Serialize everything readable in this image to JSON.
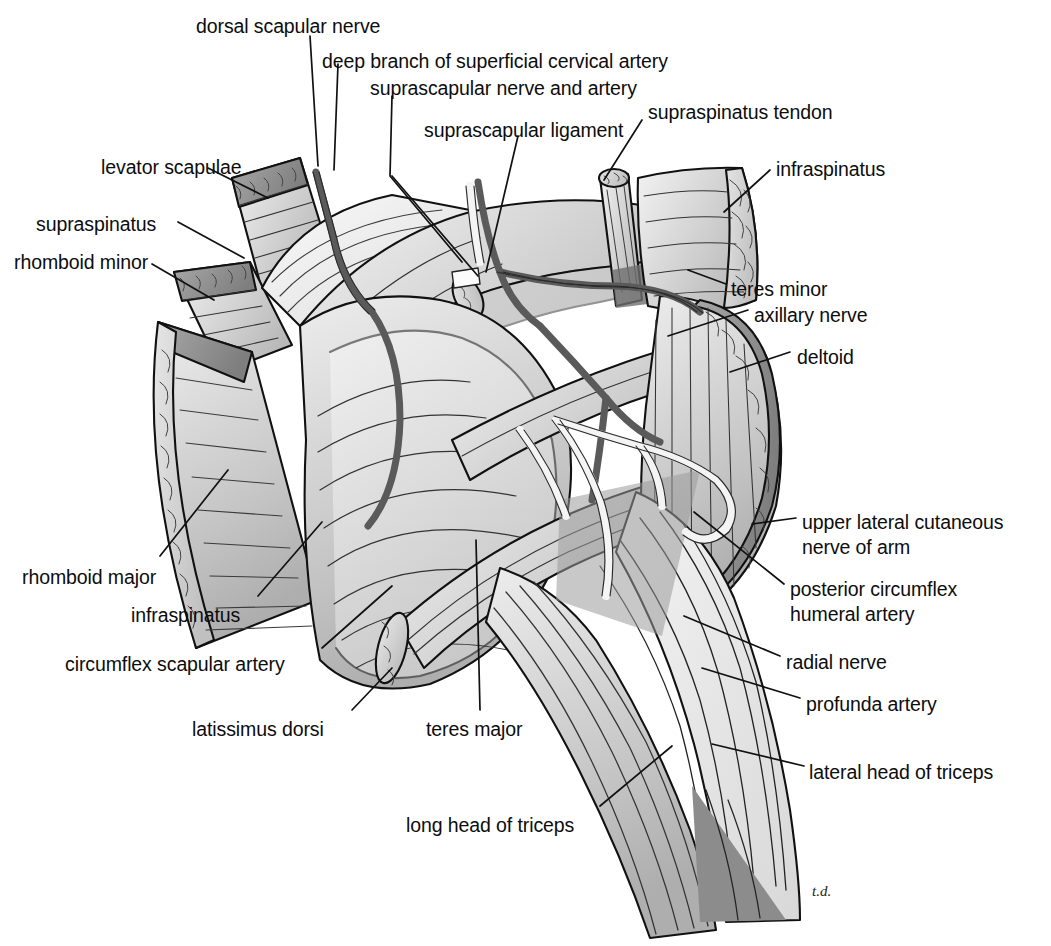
{
  "figure": {
    "signature": "t.d.",
    "background_color": "#ffffff",
    "ink_color": "#111111"
  },
  "labels": [
    {
      "id": "dorsal-scapular-nerve",
      "text": "dorsal scapular nerve",
      "x": 196,
      "y": 14,
      "align": "left"
    },
    {
      "id": "deep-branch-superficial-cervical",
      "text": "deep branch of superficial cervical artery",
      "x": 322,
      "y": 49,
      "align": "left"
    },
    {
      "id": "suprascapular-nerve-and-artery",
      "text": "suprascapular nerve and artery",
      "x": 370,
      "y": 76,
      "align": "left"
    },
    {
      "id": "suprascapular-ligament",
      "text": "suprascapular ligament",
      "x": 424,
      "y": 118,
      "align": "left"
    },
    {
      "id": "supraspinatus-tendon",
      "text": "supraspinatus tendon",
      "x": 648,
      "y": 100,
      "align": "left"
    },
    {
      "id": "infraspinatus-right",
      "text": "infraspinatus",
      "x": 776,
      "y": 157,
      "align": "left"
    },
    {
      "id": "levator-scapulae",
      "text": "levator scapulae",
      "x": 101,
      "y": 155,
      "align": "left"
    },
    {
      "id": "supraspinatus-left",
      "text": "supraspinatus",
      "x": 36,
      "y": 212,
      "align": "left"
    },
    {
      "id": "rhomboid-minor",
      "text": "rhomboid minor",
      "x": 14,
      "y": 250,
      "align": "left"
    },
    {
      "id": "teres-minor",
      "text": "teres minor",
      "x": 731,
      "y": 277,
      "align": "left"
    },
    {
      "id": "axillary-nerve",
      "text": "axillary nerve",
      "x": 754,
      "y": 303,
      "align": "left"
    },
    {
      "id": "deltoid",
      "text": "deltoid",
      "x": 797,
      "y": 345,
      "align": "left"
    },
    {
      "id": "upper-lateral-cutaneous-nerve",
      "text": "upper lateral cutaneous\nnerve of arm",
      "x": 802,
      "y": 510,
      "align": "left"
    },
    {
      "id": "posterior-circumflex-humeral",
      "text": "posterior circumflex\nhumeral artery",
      "x": 790,
      "y": 577,
      "align": "left"
    },
    {
      "id": "radial-nerve",
      "text": "radial nerve",
      "x": 786,
      "y": 650,
      "align": "left"
    },
    {
      "id": "profunda-artery",
      "text": "profunda artery",
      "x": 806,
      "y": 692,
      "align": "left"
    },
    {
      "id": "lateral-head-of-triceps",
      "text": "lateral head of triceps",
      "x": 809,
      "y": 760,
      "align": "left"
    },
    {
      "id": "rhomboid-major",
      "text": "rhomboid major",
      "x": 22,
      "y": 565,
      "align": "left"
    },
    {
      "id": "infraspinatus-left",
      "text": "infraspinatus",
      "x": 131,
      "y": 603,
      "align": "left"
    },
    {
      "id": "circumflex-scapular-artery",
      "text": "circumflex scapular artery",
      "x": 65,
      "y": 652,
      "align": "left"
    },
    {
      "id": "latissimus-dorsi",
      "text": "latissimus dorsi",
      "x": 192,
      "y": 717,
      "align": "left"
    },
    {
      "id": "teres-major",
      "text": "teres major",
      "x": 426,
      "y": 717,
      "align": "left"
    },
    {
      "id": "long-head-of-triceps",
      "text": "long head of triceps",
      "x": 406,
      "y": 813,
      "align": "left"
    }
  ]
}
